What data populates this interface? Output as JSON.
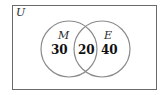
{
  "diagram": {
    "type": "venn",
    "universe_label": "U",
    "sets": [
      {
        "label": "M",
        "only_value": "30"
      },
      {
        "label": "E",
        "only_value": "40"
      }
    ],
    "intersection_value": "20",
    "colors": {
      "stroke_circle": "#8a8a8a",
      "stroke_rect": "#6a6a6a",
      "text": "#111111"
    }
  }
}
